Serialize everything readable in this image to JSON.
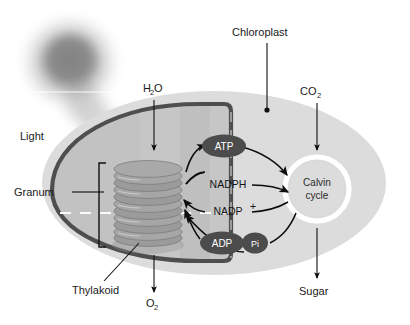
{
  "figure": {
    "type": "biology-process-diagram",
    "background_color": "#ffffff"
  },
  "colors": {
    "chloroplast_outer": "#dcdcdc",
    "chloroplast_inner_fill": "#c9c9c9",
    "stroma_fill": "#bdbdbd",
    "membrane_stroke": "#4a4a4a",
    "molecule_oval": "#4a4a4a",
    "molecule_text": "#ffffff",
    "calvin_ring": "#ffffff",
    "arrow": "#0d0d0d",
    "label_text": "#1a1a1a",
    "thylakoid_disc": "#9a9a9a",
    "light_glow": "#a8a8a8"
  },
  "labels": {
    "light": "Light",
    "granum": "Granum",
    "thylakoid": "Thylakoid",
    "chloroplast": "Chloroplast",
    "water": "H",
    "water_sub": "2",
    "water_tail": "O",
    "oxygen": "O",
    "oxygen_sub": "2",
    "carbon_dioxide": "CO",
    "carbon_dioxide_sub": "2",
    "sugar": "Sugar"
  },
  "molecules": {
    "atp": "ATP",
    "adp": "ADP",
    "pi": "Pi",
    "nadph": "NADPH",
    "nadp": "NADP",
    "nadp_sup": "+"
  },
  "calvin": {
    "line1": "Calvin",
    "line2": "cycle"
  },
  "structures": {
    "granum_disc_count": 10,
    "light_source": "sun-glow",
    "dashed_divider": "thylakoid-lumen-dashed-line"
  },
  "flows": [
    {
      "name": "h2o-in",
      "from": "H2O",
      "to": "granum",
      "direction": "down"
    },
    {
      "name": "o2-out",
      "from": "granum",
      "to": "O2",
      "direction": "down"
    },
    {
      "name": "co2-in",
      "from": "CO2",
      "to": "calvin-cycle",
      "direction": "down"
    },
    {
      "name": "sugar-out",
      "from": "calvin-cycle",
      "to": "Sugar",
      "direction": "down"
    },
    {
      "name": "atp-to-calvin",
      "from": "ATP",
      "to": "calvin-cycle",
      "direction": "right"
    },
    {
      "name": "nadph-to-calvin",
      "from": "NADPH",
      "to": "calvin-cycle",
      "direction": "right"
    },
    {
      "name": "nadp-to-granum",
      "from": "NADP+",
      "to": "granum",
      "direction": "left"
    },
    {
      "name": "adp-to-granum",
      "from": "ADP",
      "to": "granum",
      "direction": "left"
    },
    {
      "name": "pi-to-granum",
      "from": "Pi",
      "to": "granum",
      "direction": "left"
    },
    {
      "name": "granum-to-atp",
      "from": "granum",
      "to": "ATP",
      "direction": "up"
    },
    {
      "name": "granum-to-nadph",
      "from": "granum",
      "to": "NADPH",
      "direction": "right"
    },
    {
      "name": "calvin-to-adp",
      "from": "calvin-cycle",
      "to": "ADP",
      "direction": "left"
    }
  ]
}
